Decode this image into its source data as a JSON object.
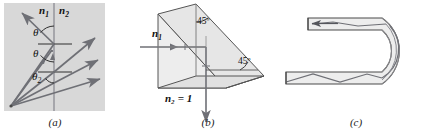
{
  "figure": {
    "panels": [
      {
        "id": "a",
        "caption": "(a)",
        "description": "Rays from a point source inside medium n1 striking a plane interface with n2 at increasing angles of incidence, showing refraction and total internal reflection",
        "background_color": "#d8d8d8",
        "labels": {
          "medium_incident": "n",
          "medium_incident_sub": "1",
          "medium_transmitted": "n",
          "medium_transmitted_sub": "2",
          "angle_incidence": "θ",
          "angle_reflection": "θ",
          "angle_critical": "θ",
          "angle_critical_sub": "2"
        }
      },
      {
        "id": "b",
        "caption": "(b)",
        "description": "A 45-45-90 glass prism used as a reflector; incoming horizontal ray totally internally reflects at the hypotenuse and exits downward",
        "background_color": "#ffffff",
        "labels": {
          "medium_incident": "n",
          "medium_incident_sub": "1",
          "medium_outside": "n₂ = 1",
          "angle_top": "45º",
          "angle_right": "45º"
        }
      },
      {
        "id": "c",
        "caption": "(c)",
        "description": "A U-bent light pipe in which a ray zigzags along the guide by repeated total internal reflection and exits through the upper arm",
        "background_color": "#ffffff"
      }
    ],
    "colors": {
      "ray": "#6f7076",
      "outline": "#3a3a3a",
      "panel_a_fill": "#d8d8d8",
      "glass_fill": "#ececec",
      "text": "#111111"
    }
  }
}
